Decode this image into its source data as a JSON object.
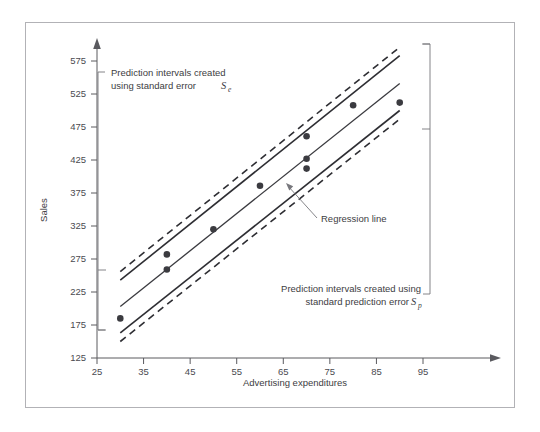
{
  "page": {
    "top_artifact_text": " "
  },
  "figure": {
    "name": "prediction-intervals-figure",
    "background": "#ffffff",
    "border_color": "#b2b2b6"
  },
  "annotations": [
    {
      "id": "se-annotation",
      "line1": "Prediction intervals created",
      "line2": "using standard error",
      "symbol": "S",
      "subscript": "e"
    },
    {
      "id": "sp-annotation",
      "line1": "Prediction intervals created using",
      "line2": "standard prediction error",
      "symbol": "S",
      "subscript": "p"
    },
    {
      "id": "regression-line-annotation",
      "label": "Regression line"
    }
  ],
  "chart_data": {
    "type": "scatter",
    "title": "",
    "subtitle": "",
    "xlabel": "Advertising expenditures",
    "ylabel": "Sales",
    "xlim": [
      25,
      95
    ],
    "ylim": [
      125,
      575
    ],
    "xticks": [
      25,
      35,
      45,
      55,
      65,
      75,
      85,
      95
    ],
    "yticks": [
      125,
      175,
      225,
      275,
      325,
      375,
      425,
      475,
      525,
      575
    ],
    "xtick_labels": [
      "25",
      "35",
      "45",
      "55",
      "65",
      "75",
      "85",
      "95"
    ],
    "ytick_labels": [
      "125",
      "175",
      "225",
      "275",
      "325",
      "375",
      "425",
      "475",
      "525",
      "575"
    ],
    "grid": false,
    "legend": null,
    "points": [
      {
        "x": 30,
        "y": 185
      },
      {
        "x": 40,
        "y": 259
      },
      {
        "x": 40,
        "y": 282
      },
      {
        "x": 50,
        "y": 320
      },
      {
        "x": 60,
        "y": 386
      },
      {
        "x": 70,
        "y": 412
      },
      {
        "x": 70,
        "y": 427
      },
      {
        "x": 70,
        "y": 461
      },
      {
        "x": 80,
        "y": 508
      },
      {
        "x": 90,
        "y": 512
      }
    ],
    "series": [
      {
        "name": "Regression line",
        "type": "line",
        "style": "solid",
        "x": [
          30,
          90
        ],
        "values": [
          203,
          541
        ]
      },
      {
        "name": "Upper prediction interval (standard error Se)",
        "type": "line",
        "style": "solid",
        "x": [
          30,
          90
        ],
        "values": [
          243,
          583
        ]
      },
      {
        "name": "Lower prediction interval (standard error Se)",
        "type": "line",
        "style": "solid",
        "x": [
          30,
          90
        ],
        "values": [
          163,
          500
        ]
      },
      {
        "name": "Upper prediction interval (standard prediction error Sp)",
        "type": "line",
        "style": "dashed",
        "x": [
          30,
          90
        ],
        "values": [
          256,
          596
        ]
      },
      {
        "name": "Lower prediction interval (standard prediction error Sp)",
        "type": "line",
        "style": "dashed",
        "x": [
          30,
          90
        ],
        "values": [
          150,
          487
        ]
      }
    ],
    "colors": {
      "point": "#3b3b40",
      "regression_line": "#3a3a3f",
      "interval_solid": "#2e2e33",
      "interval_dashed": "#2e2e33",
      "axis": "#5a5a5f",
      "text": "#3d3d42"
    }
  }
}
